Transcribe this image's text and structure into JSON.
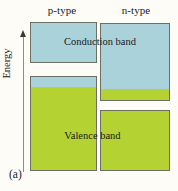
{
  "figure": {
    "panel_label": "(a)",
    "background_color": "#fdfcf6"
  },
  "axis": {
    "energy_label": "Energy",
    "arrow_icon": "up-arrow-icon",
    "direction": "up",
    "line_color": "#8d8d86"
  },
  "columns": [
    {
      "id": "p-type",
      "label": "p-type"
    },
    {
      "id": "n-type",
      "label": "n-type"
    }
  ],
  "captions": {
    "conduction": "Conduction band",
    "valence": "Valence band"
  },
  "colors": {
    "conduction_fill": "#a9d2da",
    "valence_fill": "#b4d332",
    "box_border": "#6d6f63"
  },
  "chart_data": {
    "type": "diagram",
    "title": "",
    "subtitle": "",
    "xlabel": "",
    "ylabel": "Energy",
    "grid": false,
    "legend": "none",
    "categories": [
      "p-type",
      "n-type"
    ],
    "annotations": [
      "Conduction band",
      "Valence band",
      "(a)"
    ],
    "bands": [
      {
        "side": "p-type",
        "band": "conduction",
        "fill": "#a9d2da",
        "x": 30,
        "y": 22,
        "width": 67,
        "height": 41
      },
      {
        "side": "p-type",
        "band": "valence",
        "fill": "#b4d332",
        "cap_fill": "#a9d2da",
        "cap_height": 10,
        "x": 30,
        "y": 76,
        "width": 67,
        "height": 95
      },
      {
        "side": "n-type",
        "band": "conduction",
        "fill": "#a9d2da",
        "floor_fill": "#b4d332",
        "floor_height": 11,
        "x": 100,
        "y": 23,
        "width": 70,
        "height": 78
      },
      {
        "side": "n-type",
        "band": "valence",
        "fill": "#b4d332",
        "x": 100,
        "y": 110,
        "width": 70,
        "height": 61
      }
    ]
  }
}
